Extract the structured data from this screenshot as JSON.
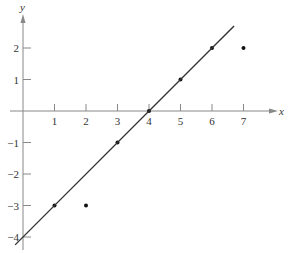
{
  "chart_data": {
    "type": "scatter",
    "title": "",
    "xlabel": "x",
    "ylabel": "y",
    "xlim": [
      -0.5,
      8
    ],
    "ylim": [
      -4.3,
      3.5
    ],
    "grid": false,
    "x_ticks": [
      1,
      2,
      3,
      4,
      5,
      6,
      7
    ],
    "y_ticks": [
      2,
      1,
      -1,
      -2,
      -3,
      -4
    ],
    "x_tick_labels": [
      "1",
      "2",
      "3",
      "4",
      "5",
      "6",
      "7"
    ],
    "y_tick_labels": [
      "2",
      "1",
      "−1",
      "−2",
      "−3",
      "−4"
    ],
    "series": [
      {
        "name": "data points",
        "type": "scatter",
        "x": [
          1,
          2,
          3,
          4,
          5,
          6,
          7
        ],
        "y": [
          -3,
          -3,
          -1,
          0,
          1,
          2,
          2
        ]
      },
      {
        "name": "fitted line y = x - 4",
        "type": "line",
        "x": [
          -0.25,
          6.7
        ],
        "y": [
          -4.25,
          2.7
        ]
      }
    ],
    "colors": {
      "axis": "#888888",
      "line": "#333333",
      "points": "#111111",
      "text": "#333333"
    }
  }
}
